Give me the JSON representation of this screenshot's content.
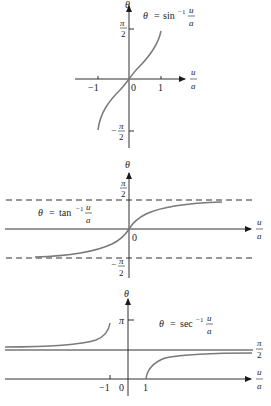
{
  "diagram": {
    "type": "function-graphs",
    "graphs": [
      {
        "id": "arcsin",
        "equation": {
          "lhs": "θ",
          "eq": "=",
          "fn": "sin",
          "sup": "−1",
          "num": "u",
          "den": "a"
        },
        "y_axis_label": "θ",
        "x_axis_label": {
          "num": "u",
          "den": "a"
        },
        "x_ticks": [
          "−1",
          "0",
          "1"
        ],
        "y_ticks": [
          {
            "sign": "",
            "num": "π",
            "den": "2"
          },
          {
            "sign": "−",
            "num": "π",
            "den": "2"
          }
        ],
        "domain": [
          -1,
          1
        ],
        "range": [
          "−π/2",
          "π/2"
        ]
      },
      {
        "id": "arctan",
        "equation": {
          "lhs": "θ",
          "eq": "=",
          "fn": "tan",
          "sup": "−1",
          "num": "u",
          "den": "a"
        },
        "y_axis_label": "θ",
        "x_axis_label": {
          "num": "u",
          "den": "a"
        },
        "x_ticks": [
          "0"
        ],
        "y_ticks": [
          {
            "sign": "",
            "num": "π",
            "den": "2"
          },
          {
            "sign": "−",
            "num": "π",
            "den": "2"
          }
        ],
        "asymptotes": [
          "θ = π/2",
          "θ = −π/2"
        ]
      },
      {
        "id": "arcsec",
        "equation": {
          "lhs": "θ",
          "eq": "=",
          "fn": "sec",
          "sup": "−1",
          "num": "u",
          "den": "a"
        },
        "y_axis_label": "θ",
        "x_axis_label": {
          "num": "u",
          "den": "a"
        },
        "x_ticks": [
          "−1",
          "0",
          "1"
        ],
        "y_ticks": [
          {
            "sign": "",
            "num": "π",
            "den": ""
          },
          {
            "sign": "",
            "num": "π",
            "den": "2"
          }
        ],
        "asymptotes": [
          "θ = π/2"
        ]
      }
    ]
  },
  "colors": {
    "axis": "#1a1a1a",
    "curve": "#7a7a7a",
    "background": "#ffffff"
  }
}
